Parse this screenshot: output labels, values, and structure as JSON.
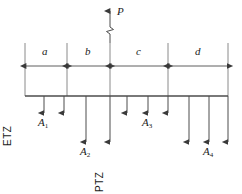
{
  "figure": {
    "type": "structural-beam-load-diagram",
    "stroke_color": "#4d4d4d",
    "text_color": "#1a1a1a",
    "background": "#ffffff"
  },
  "applied_load": {
    "label": "P",
    "direction": "up",
    "icon": "up-arrow-icon",
    "break_symbol": "line-break-symbol"
  },
  "dimensions": {
    "segments": [
      {
        "label": "a",
        "x_start": 25,
        "x_end": 67
      },
      {
        "label": "b",
        "x_start": 67,
        "x_end": 110
      },
      {
        "label": "c",
        "x_start": 110,
        "x_end": 168
      },
      {
        "label": "d",
        "x_start": 168,
        "x_end": 228
      }
    ]
  },
  "zones": [
    {
      "label": "ETZ",
      "orientation": "vertical"
    },
    {
      "label": "PTZ",
      "orientation": "vertical"
    }
  ],
  "loads": [
    {
      "label": "A1",
      "base": "A",
      "sub": "1",
      "x": 44
    },
    {
      "label": "A2",
      "base": "A",
      "sub": "2",
      "x": 86
    },
    {
      "label": "A3",
      "base": "A",
      "sub": "3",
      "x": 148
    },
    {
      "label": "A4",
      "base": "A",
      "sub": "4",
      "x": 209
    }
  ],
  "load_arrows": {
    "short": [
      44,
      64,
      127,
      148,
      168
    ],
    "long": [
      86,
      110,
      189,
      209,
      228
    ]
  }
}
